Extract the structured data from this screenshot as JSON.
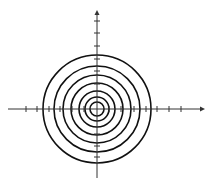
{
  "diagram": {
    "type": "concentric-circles-on-axes",
    "center": {
      "x": 97,
      "y": 109
    },
    "circle_count": 7,
    "radii": [
      7,
      12,
      18,
      26,
      34,
      43,
      54
    ],
    "stroke_color": "#111111",
    "axis_color": "#333333",
    "x_axis": {
      "from": 8,
      "to": 205,
      "ticks": [
        26,
        37,
        49,
        60,
        72,
        84,
        109,
        121,
        134,
        146,
        157,
        169,
        181
      ]
    },
    "y_axis": {
      "from": 178,
      "to": 10,
      "ticks": [
        21,
        33,
        46,
        59,
        71,
        84,
        134,
        146,
        157
      ]
    }
  }
}
